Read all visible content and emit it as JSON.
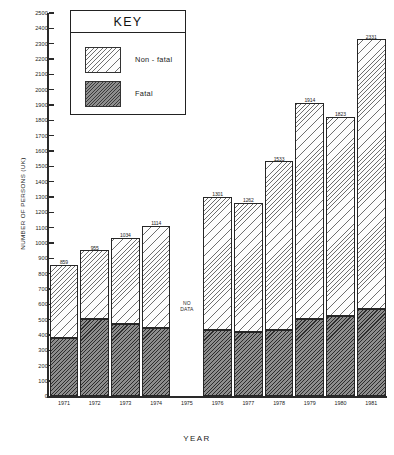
{
  "chart_data": {
    "type": "bar",
    "subtype": "stacked-bar",
    "title": "",
    "xlabel": "YEAR",
    "ylabel": "NUMBER OF PERSONS (UK)",
    "ylim": [
      0,
      2500
    ],
    "ytick_step": 100,
    "ytick_labels": [
      "0",
      "100",
      "200",
      "300",
      "400",
      "500",
      "600",
      "700",
      "800",
      "900",
      "1000",
      "1100",
      "1200",
      "1300",
      "1400",
      "1500",
      "1600",
      "1700",
      "1800",
      "1900",
      "2000",
      "2100",
      "2200",
      "2300",
      "2400",
      "2500"
    ],
    "grid": false,
    "legend_position": "top-left-inset",
    "categories": [
      "1971",
      "1972",
      "1973",
      "1974",
      "1975",
      "1976",
      "1977",
      "1978",
      "1979",
      "1980",
      "1981"
    ],
    "series": [
      {
        "name": "Fatal",
        "values": [
          381,
          503,
          474,
          449,
          null,
          436,
          417,
          430,
          503,
          525,
          572
        ]
      },
      {
        "name": "Non-fatal",
        "values": [
          478,
          452,
          560,
          665,
          null,
          865,
          845,
          1103,
          1411,
          1298,
          1759
        ]
      }
    ],
    "totals": [
      859,
      955,
      1034,
      1114,
      null,
      1301,
      1262,
      1533,
      1914,
      1823,
      2331
    ],
    "total_labels": [
      "859",
      "955",
      "1034",
      "1114",
      "",
      "1301",
      "1262",
      "1533",
      "1914",
      "1823",
      "2331"
    ],
    "fatal_labels": [
      "381",
      "503",
      "474",
      "449",
      "",
      "436",
      "417",
      "430",
      "503",
      "525",
      "572"
    ],
    "missing_note": "NO\nDATA",
    "missing_note_line1": "NO",
    "missing_note_line2": "DATA",
    "missing_category": "1975"
  },
  "key": {
    "title": "KEY",
    "items": [
      {
        "label": "Non - fatal",
        "swatch": "hatched-light"
      },
      {
        "label": "Fatal",
        "swatch": "hatched-dark"
      }
    ]
  },
  "colors": {
    "axis": "#2a2a2a",
    "text": "#1a1a1a",
    "nonfatal_fill": "#fdfdfd",
    "nonfatal_hatch": "#6f6f6f",
    "fatal_fill": "#8d8d8d",
    "fatal_hatch": "#2d2d2d",
    "background": "#ffffff"
  }
}
